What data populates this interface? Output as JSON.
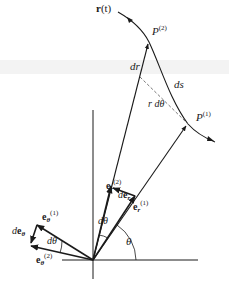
{
  "diagram": {
    "colors": {
      "ink": "#1a1a1a",
      "dashed": "#555555",
      "background": "#ffffff",
      "scan_band": "#f3f3f3"
    },
    "curve": {
      "label": "r(t)",
      "label_bold": "r",
      "label_rest": "(t)"
    },
    "points": [
      {
        "id": "P2",
        "base": "P",
        "sup": "(2)"
      },
      {
        "id": "P1",
        "base": "P",
        "sup": "(1)"
      }
    ],
    "segment_labels": {
      "dr": "dr",
      "ds": "ds",
      "r_dtheta": "r dθ"
    },
    "vectors": {
      "er1": {
        "base": "e",
        "sub": "r",
        "sup": "(1)"
      },
      "er2": {
        "base": "e",
        "sub": "r",
        "sup": "(2)"
      },
      "der": {
        "prefix": "d",
        "base": "e",
        "sub": "r"
      },
      "etheta1": {
        "base": "e",
        "sub": "θ",
        "sup": "(1)"
      },
      "etheta2": {
        "base": "e",
        "sub": "θ",
        "sup": "(2)"
      },
      "detheta": {
        "prefix": "d",
        "base": "e",
        "sub": "θ"
      }
    },
    "angles": {
      "theta": "θ",
      "dtheta_r": "dθ",
      "dtheta_theta": "dθ"
    }
  }
}
